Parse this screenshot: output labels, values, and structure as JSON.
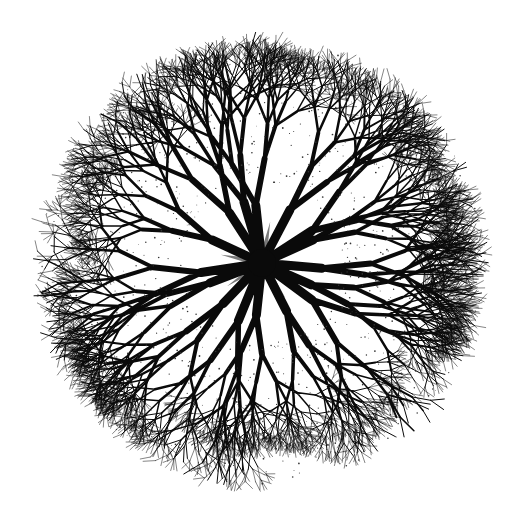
{
  "image": {
    "description": "Radial fractal tree branching pattern, viewed from above",
    "width": 522,
    "height": 532,
    "background": "#ffffff"
  },
  "figure": {
    "center": [
      262,
      263
    ],
    "radius": 228,
    "trunk_count": 16,
    "branch_color": "#0a0a0a",
    "petal_color": "#7a7a7a",
    "petal_count": 8,
    "petal_length": 42,
    "core_radius": 14,
    "max_depth": 7,
    "seed": 1337
  }
}
